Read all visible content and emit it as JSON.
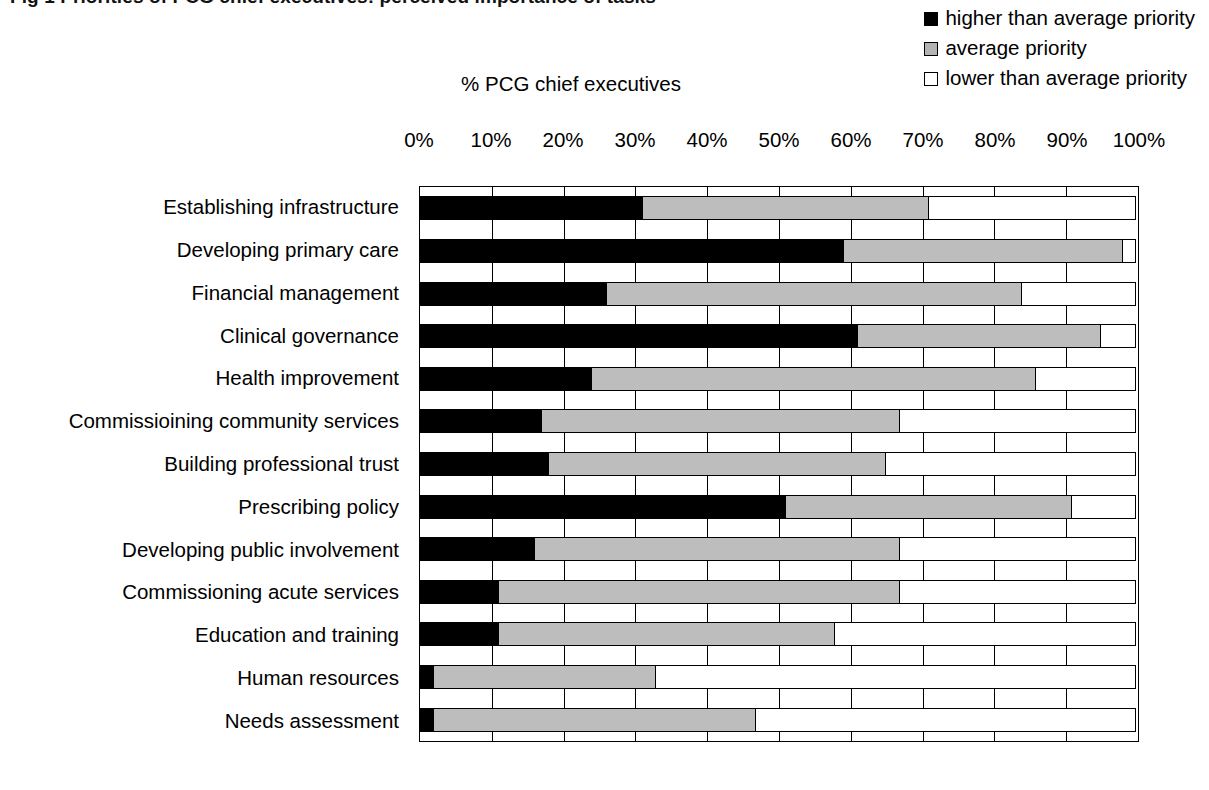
{
  "chart_data": {
    "type": "bar",
    "subtype": "stacked-horizontal-100pct",
    "title": "Fig 1  Priorities of PCG chief executives: perceived importance of tasks",
    "xlabel": "% PCG chief executives",
    "ylabel": "",
    "xlim": [
      0,
      100
    ],
    "xticks": [
      "0%",
      "10%",
      "20%",
      "30%",
      "40%",
      "50%",
      "60%",
      "70%",
      "80%",
      "90%",
      "100%"
    ],
    "grid": true,
    "legend_position": "top-right",
    "categories": [
      "Establishing infrastructure",
      "Developing primary care",
      "Financial management",
      "Clinical governance",
      "Health improvement",
      "Commissioining community services",
      "Building professional trust",
      "Prescribing policy",
      "Developing public involvement",
      "Commissioning acute services",
      "Education and training",
      "Human resources",
      "Needs assessment"
    ],
    "series": [
      {
        "name": "higher than average priority",
        "color": "#000000",
        "values": [
          31,
          59,
          26,
          61,
          24,
          17,
          18,
          51,
          16,
          11,
          11,
          2,
          2
        ]
      },
      {
        "name": "average priority",
        "color": "#bdbdbd",
        "values": [
          40,
          39,
          58,
          34,
          62,
          50,
          47,
          40,
          51,
          56,
          47,
          31,
          45
        ]
      },
      {
        "name": "lower than average priority",
        "color": "#ffffff",
        "values": [
          29,
          2,
          16,
          5,
          14,
          33,
          35,
          9,
          33,
          33,
          42,
          67,
          53
        ]
      }
    ]
  },
  "legend": {
    "items": [
      {
        "label": "higher than average priority",
        "swatch": "black-square-icon"
      },
      {
        "label": "average priority",
        "swatch": "gray-square-icon"
      },
      {
        "label": "lower than average priority",
        "swatch": "white-square-icon"
      }
    ]
  }
}
